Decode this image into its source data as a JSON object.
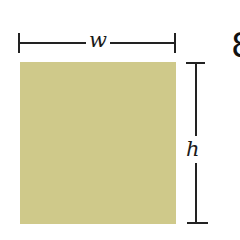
{
  "figure": {
    "shape": "rectangle",
    "fill_color": "#cfc98a",
    "line_color": "#222222",
    "width_label": "w",
    "height_label": "h",
    "partial_glyph": "8"
  }
}
